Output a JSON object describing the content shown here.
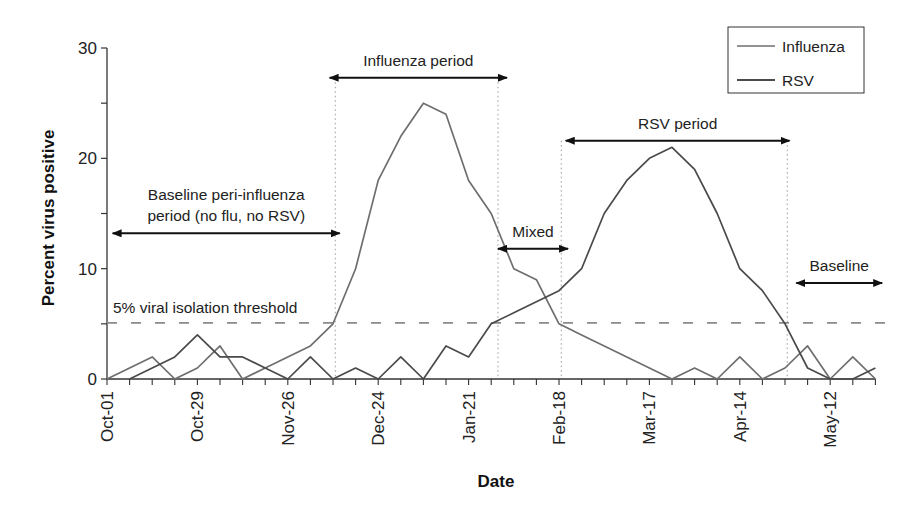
{
  "chart_data": {
    "type": "line",
    "title": "",
    "xlabel": "Date",
    "ylabel": "Percent virus positive",
    "ylim": [
      0,
      30
    ],
    "yticks": [
      0,
      10,
      20,
      30
    ],
    "grid": false,
    "legend_position": "top-right",
    "x_tick_labels": [
      "Oct-01",
      "Oct-29",
      "Nov-26",
      "Dec-24",
      "Jan-21",
      "Feb-18",
      "Mar-17",
      "Apr-14",
      "May-12"
    ],
    "x_tick_label_every_n_weeks": 4,
    "n_weeks": 35,
    "series": [
      {
        "name": "Influenza",
        "color": "#6e6e6e",
        "start_week": 0,
        "values": [
          0,
          1,
          2,
          0,
          1,
          3,
          0,
          1,
          2,
          3,
          5,
          10,
          18,
          22,
          25,
          24,
          18,
          15,
          10,
          9,
          5,
          4,
          3,
          2,
          1,
          0,
          1,
          0,
          2,
          0,
          1,
          3,
          0,
          2,
          0
        ]
      },
      {
        "name": "RSV",
        "color": "#4a4a4a",
        "start_week": 1,
        "values": [
          0,
          1,
          2,
          4,
          2,
          2,
          1,
          0,
          2,
          0,
          1,
          0,
          2,
          0,
          3,
          2,
          5,
          6,
          7,
          8,
          10,
          15,
          18,
          20,
          21,
          19,
          15,
          10,
          8,
          5,
          1,
          0,
          0,
          1
        ]
      }
    ],
    "threshold": {
      "value": 5,
      "label": "5% viral isolation threshold"
    },
    "annotations": [
      {
        "id": "baseline-peri",
        "lines": [
          "Baseline peri-influenza",
          "period (no flu, no RSV)"
        ],
        "from_week": 0.25,
        "to_week": 10.3,
        "y": 13.2
      },
      {
        "id": "influenza-period",
        "lines": [
          "Influenza period"
        ],
        "from_week": 9.85,
        "to_week": 17.7,
        "y": 27.3
      },
      {
        "id": "mixed",
        "lines": [
          "Mixed"
        ],
        "from_week": 17.3,
        "to_week": 20.4,
        "y": 11.8
      },
      {
        "id": "rsv-period",
        "lines": [
          "RSV period"
        ],
        "from_week": 20.3,
        "to_week": 30.2,
        "y": 21.6
      },
      {
        "id": "baseline",
        "lines": [
          "Baseline"
        ],
        "from_week": 30.5,
        "to_week": 34.3,
        "y": 8.7
      }
    ],
    "period_dividers_weeks": [
      10.1,
      17.3,
      20.1,
      30.1
    ]
  }
}
